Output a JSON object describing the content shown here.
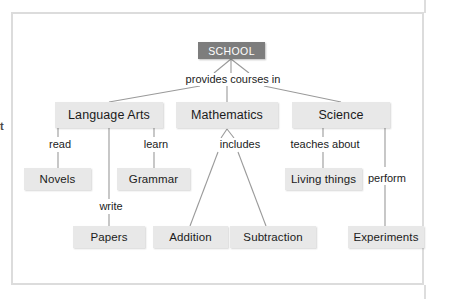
{
  "diagram": {
    "type": "concept-map",
    "title_node": "SCHOOL",
    "colors": {
      "root_fill": "#7d7d7d",
      "root_text": "#ffffff",
      "node_fill": "#e8e8e8",
      "node_text": "#1b1b1b",
      "connector": "#9a9a9a",
      "frame": "#dcdcdc",
      "background": "#ffffff"
    },
    "margin_glyph": "t",
    "nodes": [
      {
        "id": "school",
        "label": "SCHOOL",
        "level": "root"
      },
      {
        "id": "language-arts",
        "label": "Language Arts",
        "level": "branch"
      },
      {
        "id": "mathematics",
        "label": "Mathematics",
        "level": "branch"
      },
      {
        "id": "science",
        "label": "Science",
        "level": "branch"
      },
      {
        "id": "novels",
        "label": "Novels",
        "level": "leaf"
      },
      {
        "id": "grammar",
        "label": "Grammar",
        "level": "leaf"
      },
      {
        "id": "living-things",
        "label": "Living things",
        "level": "leaf"
      },
      {
        "id": "papers",
        "label": "Papers",
        "level": "leaf"
      },
      {
        "id": "addition",
        "label": "Addition",
        "level": "leaf"
      },
      {
        "id": "subtraction",
        "label": "Subtraction",
        "level": "leaf"
      },
      {
        "id": "experiments",
        "label": "Experiments",
        "level": "leaf"
      }
    ],
    "link_phrases": [
      {
        "id": "provides-courses-in",
        "label": "provides courses in",
        "from": "school",
        "to": [
          "language-arts",
          "mathematics",
          "science"
        ]
      },
      {
        "id": "read",
        "label": "read",
        "from": "language-arts",
        "to": [
          "novels"
        ]
      },
      {
        "id": "learn",
        "label": "learn",
        "from": "language-arts",
        "to": [
          "grammar"
        ]
      },
      {
        "id": "write",
        "label": "write",
        "from": "language-arts",
        "to": [
          "papers"
        ]
      },
      {
        "id": "includes",
        "label": "includes",
        "from": "mathematics",
        "to": [
          "addition",
          "subtraction"
        ]
      },
      {
        "id": "teaches-about",
        "label": "teaches about",
        "from": "science",
        "to": [
          "living-things"
        ]
      },
      {
        "id": "perform",
        "label": "perform",
        "from": "science",
        "to": [
          "experiments"
        ]
      }
    ]
  }
}
